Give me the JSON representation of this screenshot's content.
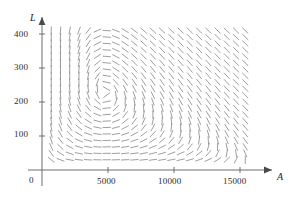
{
  "chart_data": {
    "type": "scatter",
    "subtype": "direction-field",
    "title": "",
    "xlabel": "A",
    "ylabel": "L",
    "xlim": [
      0,
      16200
    ],
    "ylim": [
      0,
      435
    ],
    "xticks": [
      5000,
      10000,
      15000
    ],
    "xtick_labels": [
      "5000",
      "10000",
      "15000"
    ],
    "yticks": [
      100,
      200,
      300,
      400
    ],
    "ytick_labels": [
      "100",
      "200",
      "300",
      "400"
    ],
    "origin_label": "0",
    "grid": false,
    "legend": null,
    "axis_arrows": true,
    "segment_color": "#8e8e8e",
    "axis_color": "#6f6f6f",
    "text_color": "#2b2b2b",
    "field": {
      "model": "predator-prey",
      "dA_dt": "0.08*A*(1 - A/17000) - 0.00025*A*L",
      "dL_dt": "-0.06*L + 0.0000125*A*L",
      "equilibrium": [
        4800,
        200
      ],
      "a_min": 700,
      "a_max": 15500,
      "a_step": 700,
      "l_min": 30,
      "l_max": 410,
      "l_step": 19,
      "segment_length_px": 7.5
    }
  },
  "axes": {
    "x_axis_name": "A",
    "y_axis_name": "L",
    "origin": "0"
  }
}
